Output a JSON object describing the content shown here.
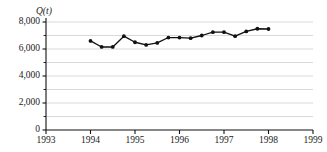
{
  "chart_data": {
    "type": "line",
    "title": "",
    "subtitle": "",
    "ylabel": "Q(t)",
    "xlabel": "",
    "xlim": [
      1993,
      1999
    ],
    "ylim": [
      0,
      8000
    ],
    "y_major_ticks": [
      0,
      2000,
      4000,
      6000,
      8000
    ],
    "y_major_tick_labels": [
      "0",
      "2,000",
      "4,000",
      "6,000",
      "8,000"
    ],
    "y_minor_ticks": [
      1000,
      3000,
      5000,
      7000
    ],
    "x_ticks": [
      1993,
      1994,
      1995,
      1996,
      1997,
      1998,
      1999
    ],
    "x_tick_labels": [
      "1993",
      "1994",
      "1995",
      "1996",
      "1997",
      "1998",
      "1999"
    ],
    "grid": "horizontal-every-1000",
    "grid_color": "#c9c9c9",
    "legend": "none",
    "marker": "filled-circle",
    "line_color": "#111111",
    "marker_color": "#111111",
    "series": [
      {
        "name": "Q(t)",
        "x": [
          1994.0,
          1994.25,
          1994.5,
          1994.75,
          1995.0,
          1995.25,
          1995.5,
          1995.75,
          1996.0,
          1996.25,
          1996.5,
          1996.75,
          1997.0,
          1997.25,
          1997.5,
          1997.75,
          1998.0
        ],
        "values": [
          6600,
          6150,
          6150,
          6950,
          6500,
          6300,
          6450,
          6850,
          6850,
          6800,
          7000,
          7250,
          7250,
          6950,
          7300,
          7500,
          7480
        ]
      }
    ]
  }
}
